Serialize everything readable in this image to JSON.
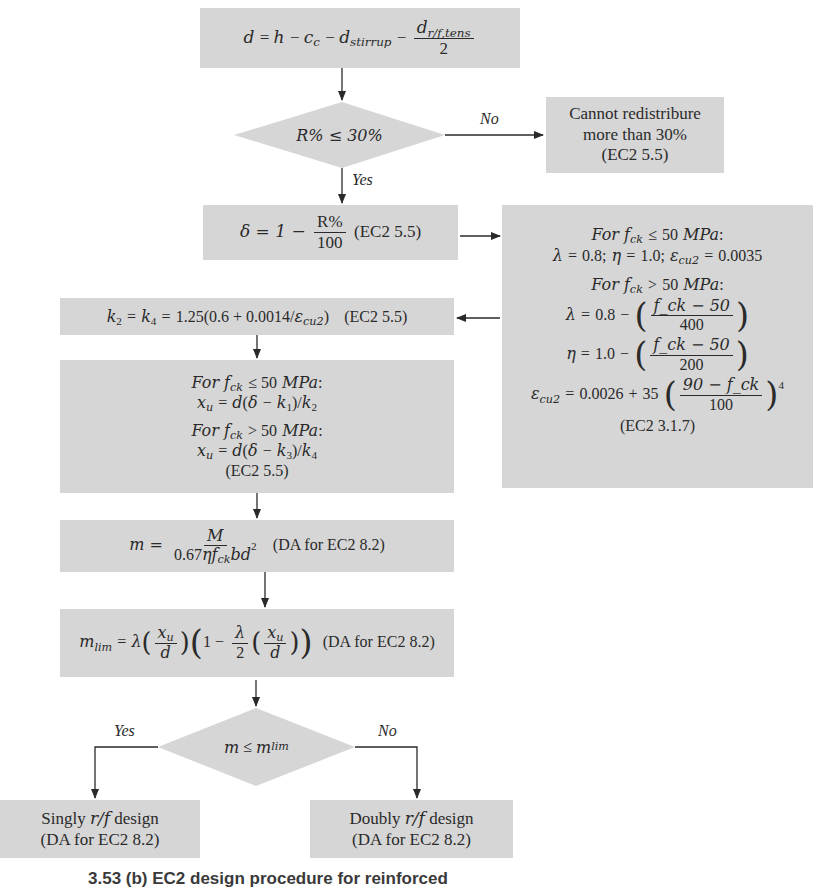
{
  "flowchart": {
    "step_effective_depth": {
      "lhs": "d",
      "expr_parts": [
        "h",
        "c",
        "c",
        "d",
        "stirrup",
        "d",
        "r/f,tens",
        "2"
      ]
    },
    "decision_redistribution": {
      "condition": "R% ≤ 30%",
      "yes_label": "Yes",
      "no_label": "No"
    },
    "box_cannot_redistribute": {
      "line1": "Cannot redistribure",
      "line2": "more than 30%",
      "line3": "(EC2 5.5)"
    },
    "step_delta": {
      "lhs": "δ = 1 −",
      "num": "R%",
      "den": "100",
      "ref": "(EC2 5.5)"
    },
    "box_parameters": {
      "cond1": "For f_ck ≤ 50 MPa:",
      "cond1_values": "λ = 0.8; η = 1.0; ε_cu2 = 0.0035",
      "cond2": "For f_ck > 50 MPa:",
      "lambda_eq": "λ = 0.8 − ((f_ck − 50)/400)",
      "eta_eq": "η = 1.0 − ((f_ck − 50)/200)",
      "epsilon_eq": "ε_cu2 = 0.0026 + 35((90 − f_ck)/100)^4",
      "ref": "(EC2 3.1.7)",
      "lambda_num": "f_ck − 50",
      "lambda_den": "400",
      "lambda_const": "0.8",
      "eta_num": "f_ck − 50",
      "eta_den": "200",
      "eta_const": "1.0",
      "eps_const": "0.0026",
      "eps_coef": "35",
      "eps_num": "90 − f_ck",
      "eps_den": "100",
      "eps_pow": "4",
      "cond_val_lambda": "0.8",
      "cond_val_eta": "1.0",
      "cond_val_eps": "0.0035",
      "mpa": "MPa",
      "fifty": "50"
    },
    "step_k": {
      "expr": "k₂ = k₄ = 1.25(0.6 + 0.0014/ε_cu2)",
      "const_a": "1.25(0.6 + 0.0014/",
      "ref": "(EC2 5.5)"
    },
    "step_xu": {
      "cond1": "For f_ck ≤ 50 MPa:",
      "eq1": "x_u = d(δ − k₁)/k₂",
      "cond2": "For f_ck > 50 MPa:",
      "eq2": "x_u = d(δ − k₃)/k₄",
      "ref": "(EC2 5.5)"
    },
    "step_m": {
      "lhs": "m =",
      "num": "M",
      "den": "0.67ηf_ck bd²",
      "ref": "(DA for EC2 8.2)"
    },
    "step_mlim": {
      "expr": "m_lim = λ(x_u/d)(1 − λ/2 (x_u/d))",
      "ref": "(DA for EC2 8.2)"
    },
    "decision_moment": {
      "condition": "m ≤ m_lim",
      "yes_label": "Yes",
      "no_label": "No"
    },
    "box_singly": {
      "line1": "Singly r/f design",
      "line2": "(DA for EC2 8.2)"
    },
    "box_doubly": {
      "line1": "Doubly r/f design",
      "line2": "(DA for EC2 8.2)"
    }
  },
  "caption": {
    "text": "3.53 (b) EC2 design procedure for reinforced"
  },
  "colors": {
    "box_fill": "#d6d6d6",
    "line": "#2a2a2a",
    "background": "#ffffff"
  }
}
